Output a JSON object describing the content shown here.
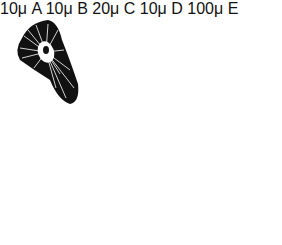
{
  "figure": {
    "panels": [
      {
        "id": "A",
        "label": "A",
        "scale": "10μ",
        "pattern": "radial-fibres-with-central-nucleus"
      },
      {
        "id": "B",
        "label": "B",
        "scale": "10μ",
        "pattern": "radial-fibres"
      },
      {
        "id": "C",
        "label": "C",
        "scale": "20μ",
        "pattern": "fine-stipple"
      },
      {
        "id": "D",
        "label": "D",
        "scale": "10μ",
        "pattern": "dotted-with-fibre-streaks"
      },
      {
        "id": "E",
        "label": "E",
        "scale": "100μ",
        "pattern": "reticulate-mesh"
      }
    ],
    "colors": {
      "ink": "#111111",
      "paper": "#ffffff"
    }
  }
}
